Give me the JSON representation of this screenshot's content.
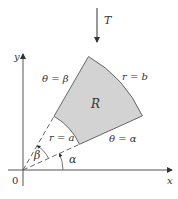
{
  "diagram": {
    "type": "polar-rectangle",
    "transform_label": "T",
    "axes": {
      "x_label": "x",
      "y_label": "y",
      "origin_label": "0"
    },
    "region_label": "R",
    "boundaries": {
      "outer_arc": "r = b",
      "inner_arc": "r = a",
      "upper_ray": "θ = β",
      "lower_ray": "θ = α"
    },
    "angle_labels": {
      "alpha": "α",
      "beta": "β"
    },
    "colors": {
      "region_fill": "#d3d3d3",
      "stroke": "#555555",
      "background": "#ffffff"
    }
  }
}
